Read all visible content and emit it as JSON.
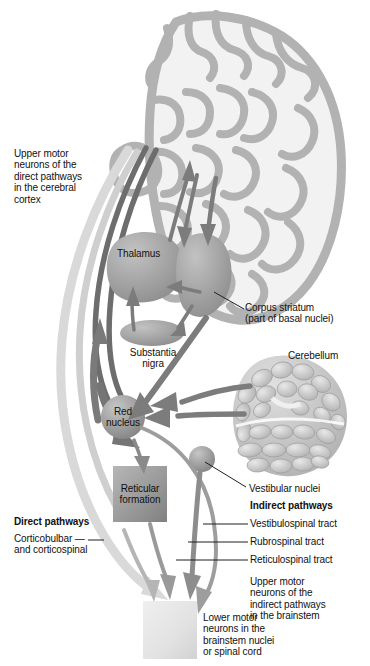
{
  "figure": {
    "type": "anatomical-diagram"
  },
  "labels": {
    "upper_motor_direct": "Upper motor\nneurons of the\ndirect pathways\nin the cerebral\ncortex",
    "thalamus": "Thalamus",
    "corpus_striatum": "Corpus striatum\n(part of basal nuclei)",
    "substantia_nigra": "Substantia\nnigra",
    "cerebellum": "Cerebellum",
    "red_nucleus": "Red\nnucleus",
    "reticular_formation": "Reticular\nformation",
    "vestibular_nuclei": "Vestibular nuclei",
    "direct_pathways_heading": "Direct pathways",
    "direct_pathways_detail": "Corticobulbar —\nand corticospinal",
    "indirect_pathways_heading": "Indirect pathways",
    "vestibulospinal_tract": "Vestibulospinal tract",
    "rubrospinal_tract": "Rubrospinal tract",
    "reticulospinal_tract": "Reticulospinal tract",
    "upper_motor_indirect": "Upper motor\nneurons of the\nindirect pathways\nin the brainstem",
    "lower_motor": "Lower motor\nneurons in the\nbrainstem nuclei\nor spinal cord"
  },
  "colors": {
    "background": "#ffffff",
    "text": "#111111",
    "cortex_fill": "#b4b4b4",
    "cortex_interior": "#f1f1f1",
    "nucleus_fill": "#a2a2a2",
    "nucleus_dark": "#8e8e8e",
    "arrow_dark": "#6e6e6e",
    "arrow_mid": "#8a8a8a",
    "pathway_light": "#d8d8d8",
    "pathway_dark": "#6b6b6b",
    "reticular_fill": "#9a9a9a",
    "lower_motor_fill": "#e4e4e4",
    "cerebellum_fill": "#c8c8c8",
    "leader_line": "#1f1f1f"
  }
}
